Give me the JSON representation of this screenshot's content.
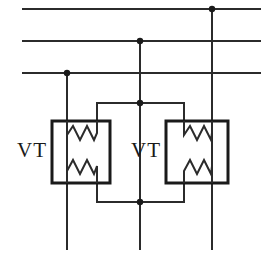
{
  "diagram": {
    "kind": "electrical-schematic",
    "width": 263,
    "height": 270,
    "background_color": "#ffffff",
    "line_color": "#2b2b2b",
    "box_color": "#1a1a1a",
    "dot_color": "#1a1a1a"
  },
  "labels": {
    "left_vt": "VT",
    "right_vt": "VT"
  },
  "bus_lines": [
    {
      "name": "bus-line-1",
      "y": 9,
      "x1": 22,
      "x2": 261
    },
    {
      "name": "bus-line-2",
      "y": 41,
      "x1": 22,
      "x2": 261
    },
    {
      "name": "bus-line-3",
      "y": 73,
      "x1": 22,
      "x2": 261
    }
  ],
  "phase_drops": [
    {
      "name": "phase-drop-left",
      "x": 67,
      "y1": 73,
      "y2": 250
    },
    {
      "name": "phase-drop-middle",
      "x": 140,
      "y1": 41,
      "y2": 250
    },
    {
      "name": "phase-drop-right",
      "x": 212,
      "y1": 9,
      "y2": 250
    }
  ],
  "junction_dots": [
    {
      "name": "junction-bus3-left",
      "x": 67,
      "y": 73,
      "r": 3.2
    },
    {
      "name": "junction-bus2-middle",
      "x": 140,
      "y": 41,
      "r": 3.2
    },
    {
      "name": "junction-bus1-right",
      "x": 212,
      "y": 9,
      "r": 3.2
    },
    {
      "name": "junction-top-bridge",
      "x": 140,
      "y": 103,
      "r": 3.2
    },
    {
      "name": "junction-bottom-bridge",
      "x": 140,
      "y": 202,
      "r": 3.2
    }
  ],
  "bridges": [
    {
      "name": "top-bridge",
      "path": "M 97 121 L 97 103 L 184 103 L 184 121"
    },
    {
      "name": "bottom-bridge",
      "path": "M 97 183 L 97 202 L 184 202 L 184 183"
    }
  ],
  "vt_units": [
    {
      "name": "left-vt-unit",
      "box": {
        "x": 52,
        "y": 121,
        "width": 58,
        "height": 62
      },
      "label_x": 32,
      "label_y": 157,
      "windings": [
        {
          "name": "left-vt-upper-winding",
          "path": "M 67 121 L 67 135 L 73 126 L 80 140 L 87 126 L 94 140 L 97 133 L 97 121"
        },
        {
          "name": "left-vt-lower-winding",
          "path": "M 67 183 L 67 171 L 73 160 L 80 174 L 87 160 L 94 174 L 97 166 L 97 183"
        }
      ]
    },
    {
      "name": "right-vt-unit",
      "box": {
        "x": 166,
        "y": 121,
        "width": 62,
        "height": 62
      },
      "label_x": 146,
      "label_y": 157,
      "windings": [
        {
          "name": "right-vt-upper-winding",
          "path": "M 184 121 L 184 135 L 190 126 L 197 140 L 204 126 L 211 140 L 212 133 L 212 121"
        },
        {
          "name": "right-vt-lower-winding",
          "path": "M 184 183 L 184 171 L 190 160 L 197 174 L 204 160 L 211 174 L 212 166 L 212 183"
        }
      ]
    }
  ]
}
